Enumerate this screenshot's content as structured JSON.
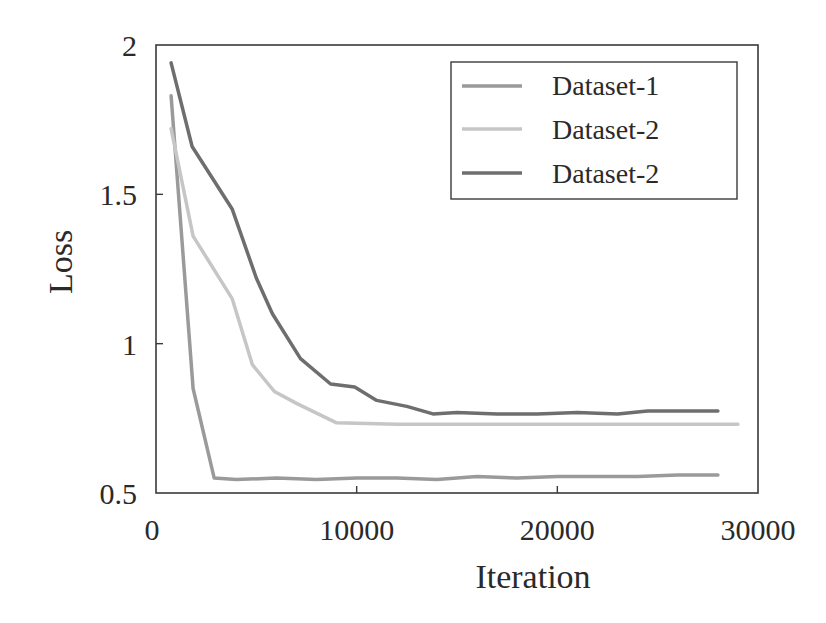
{
  "chart_data": {
    "type": "line",
    "title": "",
    "xlabel": "Iteration",
    "ylabel": "Loss",
    "xlim": [
      0,
      30000
    ],
    "ylim": [
      0.5,
      2
    ],
    "xticks": [
      0,
      10000,
      20000,
      30000
    ],
    "xtick_labels": [
      "0",
      "10000",
      "20000",
      "30000"
    ],
    "yticks": [
      0.5,
      1,
      1.5,
      2
    ],
    "ytick_labels": [
      "0.5",
      "1",
      "1.5",
      "2"
    ],
    "grid": false,
    "legend_position": "upper right",
    "series": [
      {
        "name": "Dataset-1",
        "color": "#9a9a9a",
        "x": [
          750,
          1850,
          2900,
          4000,
          6000,
          8000,
          10000,
          12000,
          14000,
          16000,
          18000,
          20000,
          22000,
          24000,
          26000,
          28000
        ],
        "y": [
          1.83,
          0.85,
          0.55,
          0.545,
          0.55,
          0.545,
          0.55,
          0.55,
          0.545,
          0.555,
          0.55,
          0.555,
          0.555,
          0.555,
          0.56,
          0.56
        ]
      },
      {
        "name": "Dataset-2",
        "color": "#c6c6c6",
        "x": [
          750,
          1850,
          3800,
          4800,
          5900,
          7000,
          9000,
          12000,
          15000,
          18000,
          21000,
          24000,
          27000,
          29000
        ],
        "y": [
          1.72,
          1.36,
          1.15,
          0.93,
          0.84,
          0.8,
          0.735,
          0.73,
          0.73,
          0.73,
          0.73,
          0.73,
          0.73,
          0.73
        ]
      },
      {
        "name": "Dataset-2",
        "color": "#6e6e6e",
        "x": [
          750,
          1800,
          3800,
          5000,
          5800,
          7200,
          8700,
          9900,
          11000,
          12500,
          13800,
          15000,
          17000,
          19000,
          21000,
          23000,
          24500,
          26000,
          28000
        ],
        "y": [
          1.94,
          1.66,
          1.45,
          1.22,
          1.1,
          0.95,
          0.865,
          0.855,
          0.81,
          0.79,
          0.765,
          0.77,
          0.765,
          0.765,
          0.77,
          0.765,
          0.775,
          0.775,
          0.775
        ]
      }
    ]
  },
  "legend": {
    "items": [
      {
        "label": "Dataset-1",
        "color": "#9a9a9a"
      },
      {
        "label": "Dataset-2",
        "color": "#c6c6c6"
      },
      {
        "label": "Dataset-2",
        "color": "#6e6e6e"
      }
    ]
  },
  "axes": {
    "x_title": "Iteration",
    "y_title": "Loss"
  }
}
